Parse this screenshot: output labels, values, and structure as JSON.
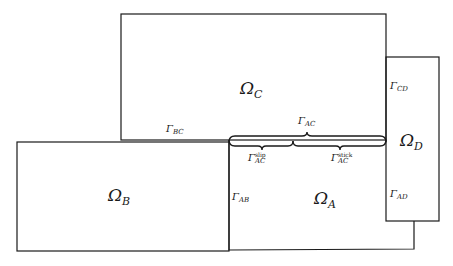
{
  "diagram": {
    "domains": {
      "omega_a": {
        "symbol": "Ω",
        "sub": "A"
      },
      "omega_b": {
        "symbol": "Ω",
        "sub": "B"
      },
      "omega_c": {
        "symbol": "Ω",
        "sub": "C"
      },
      "omega_d": {
        "symbol": "Ω",
        "sub": "D"
      }
    },
    "interfaces": {
      "gamma_bc": {
        "symbol": "Γ",
        "sub": "BC"
      },
      "gamma_ac": {
        "symbol": "Γ",
        "sub": "AC"
      },
      "gamma_ac_slip": {
        "symbol": "Γ",
        "sub": "AC",
        "sup": "slip"
      },
      "gamma_ac_stick": {
        "symbol": "Γ",
        "sub": "AC",
        "sup": "stick"
      },
      "gamma_ab": {
        "symbol": "Γ",
        "sub": "AB"
      },
      "gamma_cd": {
        "symbol": "Γ",
        "sub": "CD"
      },
      "gamma_ad": {
        "symbol": "Γ",
        "sub": "AD"
      }
    },
    "colors": {
      "stroke": "#1a1a1a",
      "background": "#ffffff"
    }
  }
}
